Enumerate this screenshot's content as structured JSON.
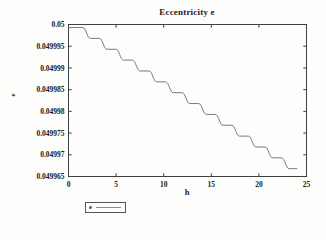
{
  "figure": {
    "title": "Eccentricity e",
    "xlabel": "h",
    "ylabel": "e",
    "legend": {
      "label": "e"
    }
  },
  "chart_data": {
    "type": "line",
    "title": "Eccentricity e",
    "xlabel": "h",
    "ylabel": "e",
    "xlim": [
      0,
      25
    ],
    "ylim": [
      0.049965,
      0.05
    ],
    "xticks": [
      0,
      5,
      10,
      15,
      20,
      25
    ],
    "xtick_labels": [
      "0",
      "5",
      "10",
      "15",
      "20",
      "25"
    ],
    "yticks": [
      0.05,
      0.049995,
      0.04999,
      0.049985,
      0.04998,
      0.049975,
      0.04997,
      0.049965
    ],
    "ytick_labels": [
      "0.05",
      "0.049995",
      "0.04999",
      "0.049985",
      "0.04998",
      "0.049975",
      "0.04997",
      "0.049965"
    ],
    "grid": false,
    "legend_position": "below-left",
    "legend_entries": [
      "e"
    ],
    "colors": {
      "line": "#7a7a7a",
      "frame": "#3f3f3f",
      "text": "#1a1a1a"
    },
    "series": [
      {
        "name": "e",
        "style": "smooth-staircase",
        "riser_width": 0.8,
        "plateaus": [
          {
            "h_start": 0.0,
            "h_end": 1.5,
            "e": 0.0499993
          },
          {
            "h_start": 2.3,
            "h_end": 3.24,
            "e": 0.0499968
          },
          {
            "h_start": 4.04,
            "h_end": 4.98,
            "e": 0.0499943
          },
          {
            "h_start": 5.78,
            "h_end": 6.72,
            "e": 0.0499918
          },
          {
            "h_start": 7.52,
            "h_end": 8.46,
            "e": 0.0499893
          },
          {
            "h_start": 9.26,
            "h_end": 10.2,
            "e": 0.0499868
          },
          {
            "h_start": 11.0,
            "h_end": 11.94,
            "e": 0.0499843
          },
          {
            "h_start": 12.74,
            "h_end": 13.68,
            "e": 0.0499818
          },
          {
            "h_start": 14.48,
            "h_end": 15.42,
            "e": 0.0499793
          },
          {
            "h_start": 16.22,
            "h_end": 17.16,
            "e": 0.0499768
          },
          {
            "h_start": 17.96,
            "h_end": 18.9,
            "e": 0.0499743
          },
          {
            "h_start": 19.7,
            "h_end": 20.64,
            "e": 0.0499718
          },
          {
            "h_start": 21.44,
            "h_end": 22.38,
            "e": 0.0499693
          },
          {
            "h_start": 23.18,
            "h_end": 24.0,
            "e": 0.0499668
          }
        ]
      }
    ]
  }
}
